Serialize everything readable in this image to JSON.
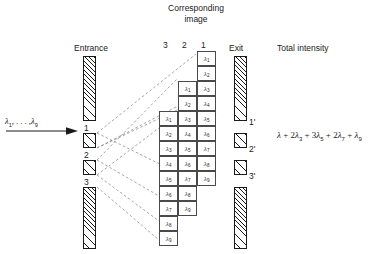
{
  "diagram": {
    "heading_corresponding_image": "Corresponding\nimage",
    "heading_line1": "Corresponding",
    "heading_line2": "image",
    "label_entrance": "Entrance",
    "label_exit": "Exit",
    "label_total_intensity": "Total intensity",
    "input_beam_label": "λ1, . . . , λ9",
    "input_beam_lambda": "λ",
    "input_beam_first_sub": "1",
    "input_beam_dots": ", . . . ,",
    "input_beam_last_sub": "9",
    "column_headers": [
      "3",
      "2",
      "1"
    ],
    "entrance_slit_labels": [
      "1",
      "2",
      "3"
    ],
    "exit_slit_labels": [
      "1'",
      "2'",
      "3'"
    ],
    "total_intensity_formula": "λ + 2λ3 + 3λ5 + 2λ7 + λ9",
    "formula_terms": [
      {
        "coef": "",
        "sym": "λ",
        "sub": ""
      },
      {
        "coef": "2",
        "sym": "λ",
        "sub": "3"
      },
      {
        "coef": "3",
        "sym": "λ",
        "sub": "5"
      },
      {
        "coef": "2",
        "sym": "λ",
        "sub": "7"
      },
      {
        "coef": "",
        "sym": "λ",
        "sub": "9"
      }
    ],
    "grid": {
      "rows": 13,
      "columns": 3,
      "column_order_left_to_right": [
        "3",
        "2",
        "1"
      ],
      "cell_contents_by_row": [
        [
          null,
          null,
          "λ1"
        ],
        [
          null,
          null,
          "λ2"
        ],
        [
          null,
          "λ1",
          "λ3"
        ],
        [
          null,
          "λ2",
          "λ4"
        ],
        [
          "λ1",
          "λ3",
          "λ5"
        ],
        [
          "λ2",
          "λ4",
          "λ6"
        ],
        [
          "λ3",
          "λ5",
          "λ7"
        ],
        [
          "λ4",
          "λ6",
          "λ8"
        ],
        [
          "λ5",
          "λ7",
          "λ9"
        ],
        [
          "λ6",
          "λ8",
          null
        ],
        [
          "λ7",
          "λ9",
          null
        ],
        [
          "λ8",
          null,
          null
        ],
        [
          "λ9",
          null,
          null
        ]
      ]
    }
  },
  "colors": {
    "ink": "#1a1a1a",
    "cell_border": "#4a4a4a",
    "background": "#ffffff",
    "ray": "#707070"
  }
}
